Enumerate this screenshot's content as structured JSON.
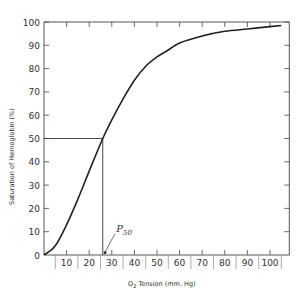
{
  "chart_data": {
    "type": "line",
    "title": "",
    "xlabel": "O2 Tension (mm. Hg)",
    "xlabel_parts": {
      "main": "O",
      "sub": "2",
      "rest": " Tension (mm. Hg)"
    },
    "ylabel": "Saturation of Hemoglobin (%)",
    "xlim": [
      0,
      105
    ],
    "ylim": [
      0,
      100
    ],
    "xticks": [
      10,
      20,
      30,
      40,
      50,
      60,
      70,
      80,
      90,
      100
    ],
    "yticks": [
      0,
      10,
      20,
      30,
      40,
      50,
      60,
      70,
      80,
      90,
      100
    ],
    "grid": false,
    "legend": null,
    "series": [
      {
        "name": "Oxyhemoglobin dissociation curve",
        "x": [
          0,
          5,
          10,
          15,
          20,
          26,
          30,
          35,
          40,
          45,
          50,
          55,
          60,
          70,
          80,
          90,
          100,
          105
        ],
        "y": [
          0,
          4,
          13,
          24,
          36,
          50,
          58,
          67,
          75,
          81,
          85,
          88,
          91,
          94,
          96,
          97,
          98,
          98.5
        ]
      }
    ],
    "annotations": [
      {
        "type": "hline",
        "y": 50,
        "x_from": 0,
        "x_to": 26
      },
      {
        "type": "vline",
        "x": 26,
        "y_from": 0,
        "y_to": 50
      },
      {
        "type": "label",
        "text": "P",
        "sub": "50",
        "x": 32,
        "y": 10,
        "arrow_to": [
          27,
          1
        ]
      }
    ],
    "p50": 26
  }
}
